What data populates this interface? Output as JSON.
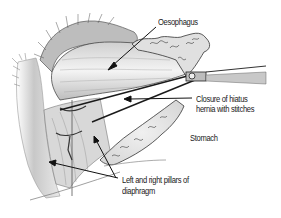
{
  "figure": {
    "labels": {
      "oesophagus": "Oesophagus",
      "closure_line1": "Closure of hiatus",
      "closure_line2": "hernia with stitches",
      "stomach": "Stomach",
      "pillars_line1": "Left and right pillars of",
      "pillars_line2": "diaphragm"
    },
    "colors": {
      "background": "#ffffff",
      "ink": "#1a1a1a",
      "shade": "#8a8a8a",
      "light_shade": "#d4d4d4"
    }
  }
}
